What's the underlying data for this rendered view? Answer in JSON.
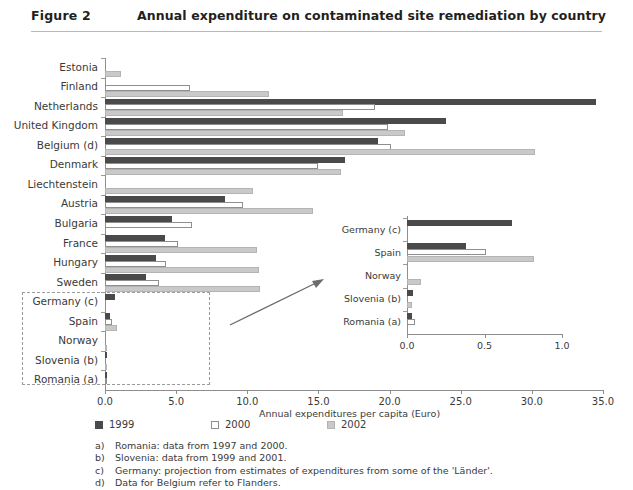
{
  "header": {
    "figure_label": "Figure 2",
    "title": "Annual expenditure on contaminated site remediation by country"
  },
  "legend": {
    "items": [
      {
        "key": "y1999",
        "label": "1999"
      },
      {
        "key": "y2000",
        "label": "2000"
      },
      {
        "key": "y2002",
        "label": "2002"
      }
    ]
  },
  "notes": [
    {
      "marker": "a)",
      "text": "Romania: data from 1997 and 2000."
    },
    {
      "marker": "b)",
      "text": "Slovenia: data from 1999 and 2001."
    },
    {
      "marker": "c)",
      "text": "Germany: projection from estimates of expenditures from some of the 'Länder'."
    },
    {
      "marker": "d)",
      "text": "Data for Belgium refer to Flanders."
    }
  ],
  "chart_data": {
    "type": "bar",
    "orientation": "horizontal",
    "title": "Annual expenditure on contaminated site remediation by country",
    "xlabel": "Annual expenditures per capita (Euro)",
    "ylabel": "",
    "xlim": [
      0.0,
      35.0
    ],
    "xticks": [
      "0.0",
      "5.0",
      "10.0",
      "15.0",
      "20.0",
      "25.0",
      "30.0",
      "35.0"
    ],
    "xtick_values": [
      0,
      5,
      10,
      15,
      20,
      25,
      30,
      35
    ],
    "grid": false,
    "legend_position": "below-axis-left",
    "categories": [
      "Estonia",
      "Finland",
      "Netherlands",
      "United Kingdom",
      "Belgium (d)",
      "Denmark",
      "Liechtenstein",
      "Austria",
      "Bulgaria",
      "France",
      "Hungary",
      "Sweden",
      "Germany (c)",
      "Spain",
      "Norway",
      "Slovenia (b)",
      "Romania (a)"
    ],
    "series": [
      {
        "name": "1999",
        "values": [
          null,
          null,
          34.5,
          24.0,
          19.2,
          16.9,
          null,
          8.4,
          4.7,
          4.2,
          3.6,
          2.9,
          0.68,
          0.38,
          null,
          0.04,
          0.03
        ]
      },
      {
        "name": "2000",
        "values": [
          null,
          6.0,
          19.0,
          19.9,
          20.1,
          15.0,
          null,
          9.7,
          6.1,
          5.1,
          4.3,
          3.8,
          null,
          0.51,
          null,
          null,
          0.05
        ]
      },
      {
        "name": "2002",
        "values": [
          1.1,
          11.5,
          16.7,
          21.1,
          30.2,
          16.6,
          10.4,
          14.6,
          null,
          10.7,
          10.8,
          10.9,
          null,
          0.82,
          0.09,
          0.035,
          null
        ]
      }
    ]
  },
  "inset": {
    "type": "bar",
    "orientation": "horizontal",
    "xlim": [
      0.0,
      1.0
    ],
    "xticks": [
      "0.0",
      "0.5",
      "1.0"
    ],
    "xtick_values": [
      0.0,
      0.5,
      1.0
    ],
    "categories": [
      "Germany (c)",
      "Spain",
      "Norway",
      "Slovenia (b)",
      "Romania (a)"
    ],
    "series": [
      {
        "name": "1999",
        "values": [
          0.68,
          0.38,
          null,
          0.04,
          0.03
        ]
      },
      {
        "name": "2000",
        "values": [
          null,
          0.51,
          null,
          null,
          0.05
        ]
      },
      {
        "name": "2002",
        "values": [
          null,
          0.82,
          0.09,
          0.035,
          null
        ]
      }
    ]
  }
}
